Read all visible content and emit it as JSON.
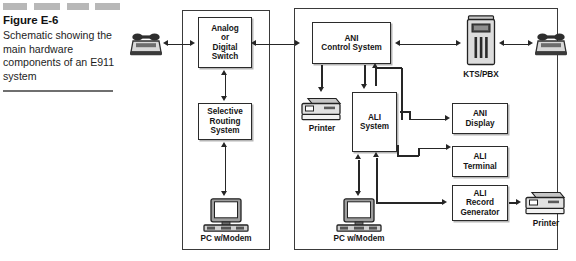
{
  "figure": {
    "label": "Figure E-6",
    "description": "Schematic showing the main hardware components of an E911 system"
  },
  "diagram": {
    "left_frame": {
      "name": "telephone-company-central-office-frame"
    },
    "right_frame": {
      "name": "psap-frame"
    },
    "boxes": {
      "analog_or_digital_switch": "Analog\nor\nDigital\nSwitch",
      "selective_routing_system": "Selective\nRouting\nSystem",
      "ani_control_system": "ANI\nControl System",
      "ali_system": "ALI\nSystem",
      "ani_display": "ANI\nDisplay",
      "ali_terminal": "ALI\nTerminal",
      "ali_record_generator": "ALI\nRecord\nGenerator"
    },
    "device_captions": {
      "kts_pbx": "KTS/PBX",
      "printer_left": "Printer",
      "printer_right": "Printer",
      "pc_modem_left": "PC w/Modem",
      "pc_modem_right": "PC w/Modem"
    },
    "icons": {
      "caller_phone": "telephone-icon",
      "psap_phone": "telephone-icon",
      "kts_pbx": "kts-pbx-cabinet-icon",
      "printer": "printer-icon",
      "workstation": "desktop-computer-icon"
    }
  },
  "colors": {
    "ink": "#262626",
    "box_border": "#2b2b2b",
    "frame_border": "#3a3a3a",
    "dash": "#b8b8b8",
    "rule": "#6f6f6f",
    "paper": "#ffffff"
  }
}
